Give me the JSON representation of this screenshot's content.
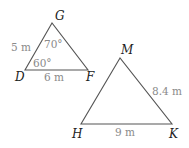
{
  "diagram": {
    "type": "geometry-triangles",
    "colors": {
      "edge": "#555555",
      "vertex_label": "#222222",
      "measure_label": "#8a8a8a",
      "background": "#ffffff"
    },
    "triangles": [
      {
        "name": "DGF",
        "vertices": {
          "G": {
            "label": "G",
            "x": 52,
            "y": 23
          },
          "D": {
            "label": "D",
            "x": 25,
            "y": 70
          },
          "F": {
            "label": "F",
            "x": 88,
            "y": 70
          }
        },
        "sides": {
          "DG": "5 m",
          "DF": "6 m"
        },
        "angles": {
          "G": "70°",
          "D": "60°"
        }
      },
      {
        "name": "HMK",
        "vertices": {
          "M": {
            "label": "M",
            "x": 120,
            "y": 58
          },
          "H": {
            "label": "H",
            "x": 81,
            "y": 124
          },
          "K": {
            "label": "K",
            "x": 172,
            "y": 124
          }
        },
        "sides": {
          "MK": "8.4 m",
          "HK": "9 m"
        }
      }
    ]
  }
}
